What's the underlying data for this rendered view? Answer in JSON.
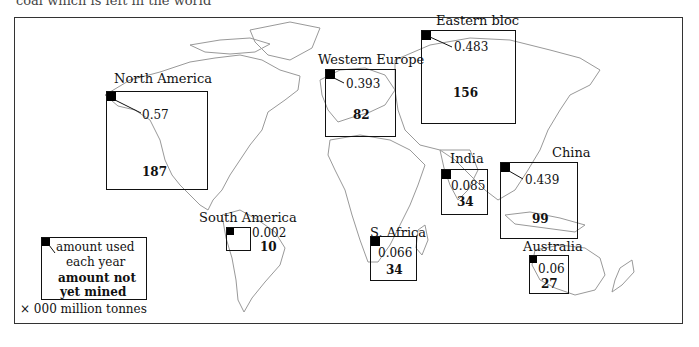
{
  "caption_clipped": "coal which is left in the world",
  "legend": {
    "used_label_line1": "amount used",
    "used_label_line2": "each year",
    "reserve_label_line1": "amount not",
    "reserve_label_line2": "yet mined",
    "units": "× 000 million tonnes"
  },
  "regions": [
    {
      "name": "North America",
      "used": "0.57",
      "reserves": "187"
    },
    {
      "name": "Western Europe",
      "used": "0.393",
      "reserves": "82"
    },
    {
      "name": "Eastern bloc",
      "used": "0.483",
      "reserves": "156"
    },
    {
      "name": "China",
      "used": "0.439",
      "reserves": "99"
    },
    {
      "name": "India",
      "used": "0.085",
      "reserves": "34"
    },
    {
      "name": "South America",
      "used": "0.002",
      "reserves": "10"
    },
    {
      "name": "S. Africa",
      "used": "0.066",
      "reserves": "34"
    },
    {
      "name": "Australia",
      "used": "0.06",
      "reserves": "27"
    }
  ]
}
